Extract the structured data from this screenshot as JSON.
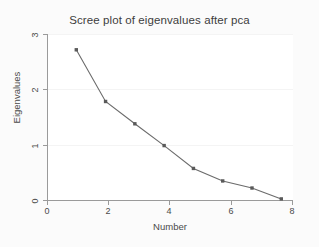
{
  "chart_data": {
    "type": "line",
    "title": "Scree plot of eigenvalues after pca",
    "xlabel": "Number",
    "ylabel": "Eigenvalues",
    "x": [
      1,
      2,
      3,
      4,
      5,
      6,
      7,
      8
    ],
    "values": [
      2.76,
      1.81,
      1.4,
      1.0,
      0.58,
      0.35,
      0.22,
      0.02
    ],
    "series": [
      {
        "name": "Eigenvalues",
        "values": [
          2.76,
          1.81,
          1.4,
          1.0,
          0.58,
          0.35,
          0.22,
          0.02
        ]
      }
    ],
    "xlim": [
      0,
      8.4
    ],
    "ylim": [
      0,
      3.05
    ],
    "xticks": [
      "0",
      "2",
      "4",
      "6",
      "8"
    ],
    "xtick_values": [
      0,
      2,
      4,
      6,
      8
    ],
    "yticks": [
      "0",
      "1",
      "2",
      "3"
    ],
    "ytick_values": [
      0,
      1,
      2,
      3
    ],
    "grid": "horizontal",
    "legend": "none",
    "marker": "filled-square",
    "line_color": "#6b6b6b",
    "marker_color": "#5a5a5a",
    "plot_background": "#ffffff",
    "graph_background": "#fbfbfb"
  }
}
